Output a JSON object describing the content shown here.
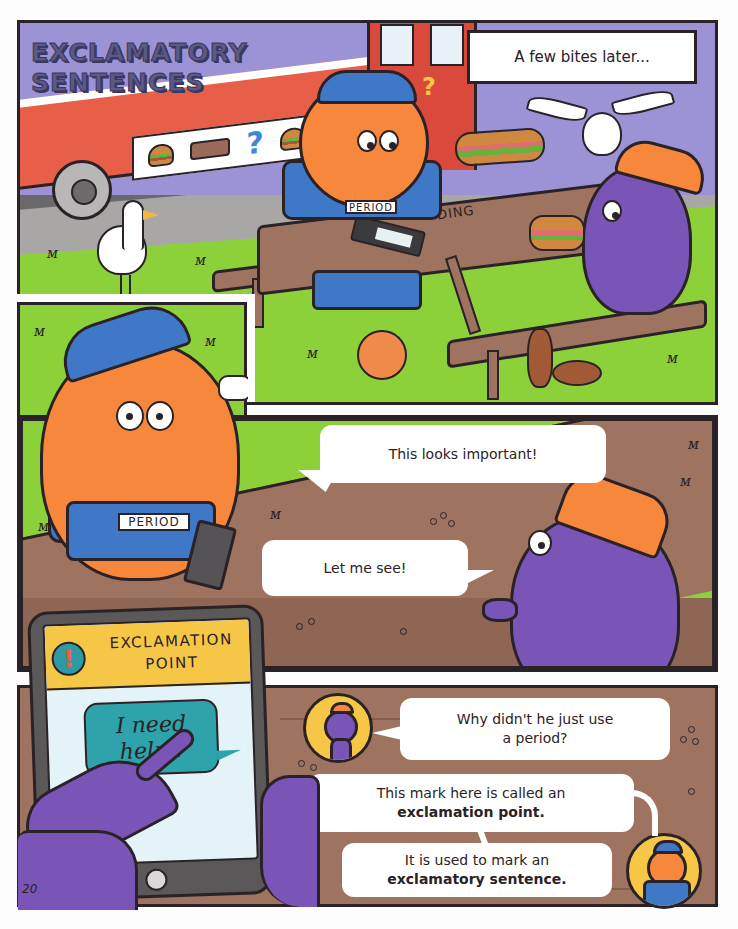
{
  "page": {
    "title": "EXCLAMATORY SENTENCES",
    "title_lines": [
      "EXCLAMATORY",
      "SENTENCES"
    ],
    "page_number": "20"
  },
  "panel1": {
    "caption": "A few bites later...",
    "sound_effect": "DING",
    "nametag": "PERIOD",
    "menu_items": [
      "burger-icon",
      "sandwich-icon",
      "question-mark-icon",
      "burger-icon"
    ],
    "truck_sign": "?"
  },
  "panel3": {
    "nametag": "PERIOD",
    "bubble_period": "This looks important!",
    "bubble_purple": "Let me see!"
  },
  "tablet": {
    "header_line1": "EXCLAMATION",
    "header_line2": "POINT",
    "badge": "!",
    "message_line1": "I need",
    "message_line2": "help !"
  },
  "panel4": {
    "question": {
      "line1": "Why didn't he just use",
      "line2": "a period?"
    },
    "explanation1": {
      "line1": "This mark here is called an",
      "line2_bold": "exclamation point."
    },
    "explanation2": {
      "line1": "It is used to mark an",
      "line2_bold": "exclamatory sentence."
    }
  },
  "colors": {
    "outline": "#2a2226",
    "sky_purple": "#9b93d6",
    "grass": "#8dd13a",
    "wood": "#9e735f",
    "period_orange": "#f7873a",
    "cap_blue": "#3f78c7",
    "purple_char": "#7a55b8",
    "yellow": "#f6c646",
    "teal": "#2fa3ab",
    "truck_red": "#e75f49"
  }
}
